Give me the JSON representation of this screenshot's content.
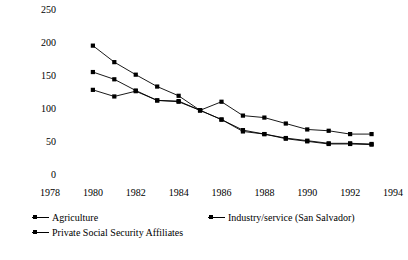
{
  "chart_data": {
    "type": "line",
    "title": "",
    "subtitle": "",
    "xlabel": "",
    "ylabel": "1985 = 100",
    "xlim": [
      1978,
      1994
    ],
    "ylim": [
      0,
      250
    ],
    "grid": false,
    "legend_position": "below-plot",
    "xticks": [
      "1978",
      "1980",
      "1982",
      "1984",
      "1986",
      "1988",
      "1990",
      "1992",
      "1994"
    ],
    "yticks": [
      "0",
      "50",
      "100",
      "150",
      "200",
      "250"
    ],
    "marker": "square",
    "line_color": "#000000",
    "series": [
      {
        "name": "Agriculture",
        "x": [
          1980,
          1981,
          1982,
          1983,
          1984,
          1985,
          1986,
          1987,
          1988,
          1989,
          1990,
          1991,
          1992,
          1993
        ],
        "values": [
          196,
          171,
          152,
          134,
          120,
          98,
          111,
          90,
          87,
          78,
          69,
          67,
          62,
          62
        ]
      },
      {
        "name": "Industry/service (San Salvador)",
        "x": [
          1980,
          1981,
          1982,
          1983,
          1984,
          1985,
          1986,
          1987,
          1988,
          1989,
          1990,
          1991,
          1992,
          1993
        ],
        "values": [
          156,
          145,
          128,
          113,
          112,
          98,
          84,
          68,
          62,
          55,
          51,
          47,
          47,
          46
        ]
      },
      {
        "name": "Private Social Security Affiliates",
        "x": [
          1980,
          1981,
          1982,
          1983,
          1984,
          1985,
          1986,
          1987,
          1988,
          1989,
          1990,
          1991,
          1992,
          1993
        ],
        "values": [
          129,
          119,
          127,
          113,
          111,
          98,
          84,
          66,
          62,
          56,
          52,
          48,
          48,
          47
        ]
      }
    ]
  },
  "legend": {
    "items": [
      {
        "label": "Agriculture"
      },
      {
        "label": "Industry/service (San Salvador)"
      },
      {
        "label": "Private Social Security Affiliates"
      }
    ]
  }
}
